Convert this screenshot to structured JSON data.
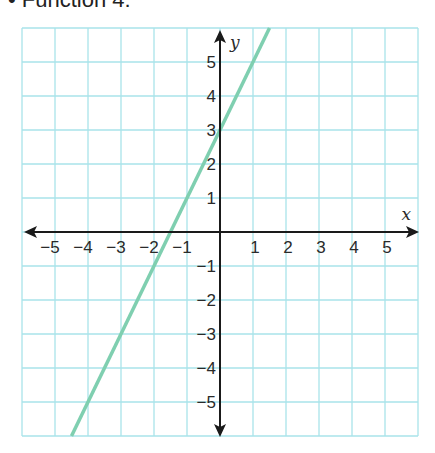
{
  "caption": "•  Function 4:",
  "chart_data": {
    "type": "line",
    "title": "Function 4",
    "xlabel": "x",
    "ylabel": "y",
    "xlim": [
      -6,
      6
    ],
    "ylim": [
      -6,
      6
    ],
    "grid": true,
    "x_ticks": [
      -5,
      -4,
      -3,
      -2,
      -1,
      1,
      2,
      3,
      4,
      5
    ],
    "y_ticks": [
      5,
      4,
      3,
      2,
      1,
      -1,
      -2,
      -3,
      -4,
      -5
    ],
    "x_tick_labels": [
      "−5",
      "−4",
      "−3",
      "−2",
      "−1",
      "1",
      "2",
      "3",
      "4",
      "5"
    ],
    "y_tick_labels": [
      "5",
      "4",
      "3",
      "2",
      "1",
      "−1",
      "−2",
      "−3",
      "−4",
      "−5"
    ],
    "series": [
      {
        "name": "Function 4",
        "equation": "y = 2x + 3",
        "slope": 2,
        "intercept": 3,
        "x": [
          -4.5,
          1.5
        ],
        "y": [
          -6,
          6
        ],
        "color": "#7fcfb0"
      }
    ]
  }
}
